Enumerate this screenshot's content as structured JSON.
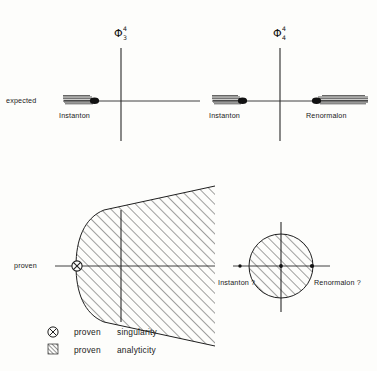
{
  "figure": {
    "background_color": "#fdfdfb",
    "ink_color": "#1a1a1a",
    "width": 377,
    "height": 371
  },
  "panels": {
    "top": {
      "row_label": "expected",
      "plots": [
        {
          "title_base": "Φ",
          "title_sup": "4",
          "title_sub": "3",
          "title_plain": "Φ⁴₃",
          "left_cut_label": "Instanton",
          "right_cut_label": ""
        },
        {
          "title_base": "Φ",
          "title_sup": "4",
          "title_sub": "4",
          "title_plain": "Φ⁴₄",
          "left_cut_label": "Instanton",
          "right_cut_label": "Renormalon"
        }
      ]
    },
    "bottom": {
      "row_label": "proven",
      "plots": [
        {
          "shape": "horn",
          "singularity_marker": "proven-singularity-marker",
          "left_label": "",
          "right_label": ""
        },
        {
          "shape": "disk",
          "left_label": "Instanton ?",
          "right_label": "Renormalon ?"
        }
      ]
    }
  },
  "legend": {
    "items": [
      {
        "icon": "circled-cross-icon",
        "word1": "proven",
        "word2": "singularity"
      },
      {
        "icon": "hatched-square-icon",
        "word1": "proven",
        "word2": "analyticity"
      }
    ]
  }
}
